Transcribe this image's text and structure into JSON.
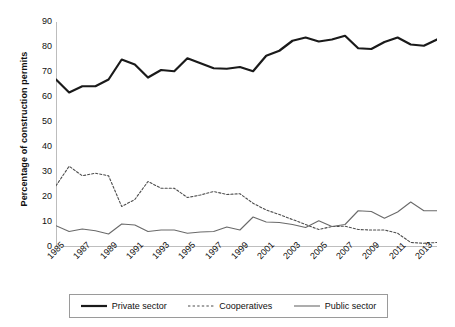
{
  "chart_data": {
    "type": "line",
    "title": "",
    "subtitle": "",
    "xlabel": "",
    "ylabel": "Percentage of construction permits",
    "xlim": [
      1985,
      2014
    ],
    "ylim": [
      0,
      90
    ],
    "ytick_values": [
      0,
      10,
      20,
      30,
      40,
      50,
      60,
      70,
      80,
      90
    ],
    "ytick_labels": [
      "0",
      "10",
      "20",
      "30",
      "40",
      "50",
      "60",
      "70",
      "80",
      "90"
    ],
    "xtick_values": [
      1985,
      1987,
      1989,
      1991,
      1993,
      1995,
      1997,
      1999,
      2001,
      2003,
      2005,
      2007,
      2009,
      2011,
      2013
    ],
    "xtick_labels": [
      "1985",
      "1987",
      "1989",
      "1991",
      "1993",
      "1995",
      "1997",
      "1999",
      "2001",
      "2003",
      "2005",
      "2007",
      "2009",
      "2011",
      "2013"
    ],
    "grid": false,
    "legend_position": "bottom",
    "x": [
      1985,
      1986,
      1987,
      1988,
      1989,
      1990,
      1991,
      1992,
      1993,
      1994,
      1995,
      1996,
      1997,
      1998,
      1999,
      2000,
      2001,
      2002,
      2003,
      2004,
      2005,
      2006,
      2007,
      2008,
      2009,
      2010,
      2011,
      2012,
      2013,
      2014
    ],
    "series": [
      {
        "name": "Private sector",
        "style": "solid-thick",
        "color": "#1a1a1a",
        "values": [
          67.0,
          61.8,
          64.3,
          64.3,
          67.0,
          75.0,
          73.0,
          67.8,
          70.8,
          70.3,
          75.5,
          73.5,
          71.5,
          71.3,
          72.0,
          70.3,
          76.5,
          78.5,
          82.5,
          83.8,
          82.2,
          83.0,
          84.5,
          79.5,
          79.2,
          82.0,
          83.8,
          81.0,
          80.5,
          83.0
        ]
      },
      {
        "name": "Cooperatives",
        "style": "dotted",
        "color": "#4d4d4d",
        "values": [
          24.5,
          32.3,
          28.5,
          29.5,
          28.5,
          16.2,
          19.0,
          26.2,
          23.5,
          23.5,
          19.8,
          20.8,
          22.2,
          21.0,
          21.3,
          17.5,
          14.8,
          13.0,
          11.0,
          9.0,
          7.0,
          8.2,
          8.3,
          7.0,
          6.8,
          6.8,
          5.5,
          1.8,
          1.5,
          1.8
        ]
      },
      {
        "name": "Public sector",
        "style": "solid-thin",
        "color": "#6a6a6a",
        "values": [
          8.5,
          6.2,
          7.2,
          6.5,
          5.2,
          9.2,
          8.8,
          6.2,
          6.8,
          6.8,
          5.5,
          6.0,
          6.2,
          8.0,
          6.8,
          12.0,
          10.0,
          9.8,
          9.0,
          7.8,
          10.5,
          8.2,
          9.0,
          14.5,
          14.2,
          11.5,
          14.0,
          18.0,
          14.5,
          14.5
        ]
      }
    ]
  },
  "legend": {
    "items": [
      {
        "label": "Private sector"
      },
      {
        "label": "Cooperatives"
      },
      {
        "label": "Public sector"
      }
    ]
  }
}
